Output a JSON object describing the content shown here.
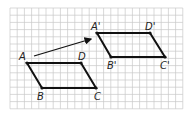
{
  "diagram": {
    "type": "translation",
    "grid": {
      "x0": 10,
      "y0": 8,
      "cols": 24,
      "rows": 14,
      "cell": 7.2,
      "color": "#c8c8c8"
    },
    "original": {
      "points": [
        {
          "label": "A",
          "x": 27,
          "y": 63,
          "lx": 19,
          "ly": 60
        },
        {
          "label": "B",
          "x": 42,
          "y": 88,
          "lx": 37,
          "ly": 100
        },
        {
          "label": "C",
          "x": 96,
          "y": 88,
          "lx": 94,
          "ly": 100
        },
        {
          "label": "D",
          "x": 81,
          "y": 63,
          "lx": 78,
          "ly": 60
        }
      ]
    },
    "image": {
      "points": [
        {
          "label": "A'",
          "x": 97,
          "y": 33,
          "lx": 91,
          "ly": 30
        },
        {
          "label": "B'",
          "x": 111,
          "y": 57,
          "lx": 107,
          "ly": 69
        },
        {
          "label": "C'",
          "x": 165,
          "y": 57,
          "lx": 160,
          "ly": 69
        },
        {
          "label": "D'",
          "x": 150,
          "y": 33,
          "lx": 145,
          "ly": 30
        }
      ]
    },
    "arrow": {
      "from": [
        34,
        56
      ],
      "to": [
        91,
        39
      ]
    },
    "stroke_color": "#111111"
  }
}
